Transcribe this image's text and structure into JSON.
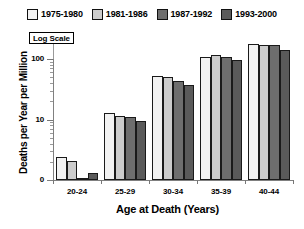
{
  "chart_data": {
    "type": "bar",
    "title": "",
    "subtitle": "",
    "xlabel": "Age at Death (Years)",
    "ylabel": "Deaths per Year per Million",
    "categories": [
      "20-24",
      "25-29",
      "30-34",
      "35-39",
      "40-44"
    ],
    "series": [
      {
        "name": "1975-1980",
        "color": "#f2f2f2",
        "values": [
          2.4,
          13.0,
          52.0,
          110.0,
          175.0
        ]
      },
      {
        "name": "1981-1986",
        "color": "#cccccc",
        "values": [
          2.1,
          11.5,
          51.0,
          115.0,
          172.0
        ]
      },
      {
        "name": "1987-1992",
        "color": "#6e6e6e",
        "values": [
          1.05,
          11.0,
          44.0,
          108.0,
          170.0
        ]
      },
      {
        "name": "1993-2000",
        "color": "#5a5a5a",
        "values": [
          1.3,
          9.5,
          38.0,
          95.0,
          140.0
        ]
      }
    ],
    "yscale": "log",
    "ylim": [
      1,
      260
    ],
    "ytick_labels": [
      "100",
      "10"
    ],
    "ytick_values": [
      100,
      10
    ],
    "yminor_ticks": [
      2,
      3,
      4,
      5,
      6,
      7,
      8,
      9,
      20,
      30,
      40,
      50,
      60,
      70,
      80,
      90,
      200
    ],
    "grid": false,
    "legend_position": "top",
    "annotation": "Log Scale",
    "baseline_label": "0"
  },
  "legend": {
    "entries": [
      {
        "label": "1975-1980"
      },
      {
        "label": "1981-1986"
      },
      {
        "label": "1987-1992"
      },
      {
        "label": "1993-2000"
      }
    ]
  },
  "axes": {
    "x_title": "Age at Death (Years)",
    "y_title": "Deaths per Year per Million",
    "x_tick_labels": [
      "20-24",
      "25-29",
      "30-34",
      "35-39",
      "40-44"
    ],
    "y_tick_labels": [
      "100",
      "10",
      "0"
    ]
  },
  "annotations": {
    "log_scale": "Log Scale"
  }
}
